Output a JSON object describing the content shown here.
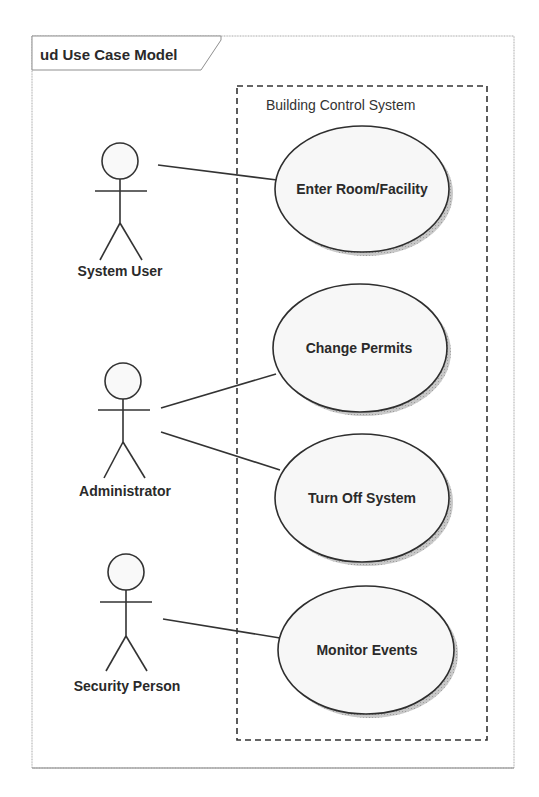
{
  "diagram": {
    "type": "UML use case diagram",
    "frame": {
      "kind": "ud",
      "title": "ud Use Case Model"
    },
    "system_boundary": {
      "label": "Building Control System"
    },
    "actors": [
      {
        "id": "system-user",
        "label": "System User"
      },
      {
        "id": "administrator",
        "label": "Administrator"
      },
      {
        "id": "security-person",
        "label": "Security Person"
      }
    ],
    "use_cases": [
      {
        "id": "enter-room-facility",
        "label": "Enter Room/Facility"
      },
      {
        "id": "change-permits",
        "label": "Change Permits"
      },
      {
        "id": "turn-off-system",
        "label": "Turn Off System"
      },
      {
        "id": "monitor-events",
        "label": "Monitor Events"
      }
    ],
    "associations": [
      {
        "from": "System User",
        "to": "Enter Room/Facility"
      },
      {
        "from": "Administrator",
        "to": "Change Permits"
      },
      {
        "from": "Administrator",
        "to": "Turn Off System"
      },
      {
        "from": "Security Person",
        "to": "Monitor Events"
      }
    ]
  },
  "colors": {
    "line": "#333333",
    "frame_border": "#9a9a9a",
    "ellipse_fill": "#f7f7f7",
    "ellipse_shadow": "#bdbdbd",
    "background": "#ffffff"
  }
}
